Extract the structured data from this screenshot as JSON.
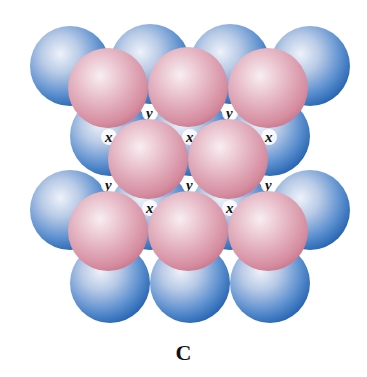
{
  "figure": {
    "caption": "C",
    "colors": {
      "layer_a": "#3f7fc4",
      "layer_a_highlight": "#e8eef8",
      "layer_b": "#d98a9e",
      "layer_b_highlight": "#f6e8ee",
      "label": "#111111"
    },
    "radius": 40,
    "layers": [
      {
        "name": "bottom-layer-blue",
        "color": "blue",
        "spheres": [
          {
            "cx": 70,
            "cy": 66
          },
          {
            "cx": 150,
            "cy": 64
          },
          {
            "cx": 230,
            "cy": 64
          },
          {
            "cx": 310,
            "cy": 66
          },
          {
            "cx": 110,
            "cy": 136
          },
          {
            "cx": 190,
            "cy": 136
          },
          {
            "cx": 270,
            "cy": 136
          },
          {
            "cx": 70,
            "cy": 210
          },
          {
            "cx": 150,
            "cy": 210
          },
          {
            "cx": 230,
            "cy": 210
          },
          {
            "cx": 310,
            "cy": 210
          },
          {
            "cx": 110,
            "cy": 283
          },
          {
            "cx": 190,
            "cy": 283
          },
          {
            "cx": 270,
            "cy": 283
          }
        ]
      },
      {
        "name": "top-layer-pink",
        "color": "pink",
        "spheres": [
          {
            "cx": 108,
            "cy": 88
          },
          {
            "cx": 188,
            "cy": 87
          },
          {
            "cx": 268,
            "cy": 88
          },
          {
            "cx": 148,
            "cy": 159
          },
          {
            "cx": 228,
            "cy": 159
          },
          {
            "cx": 108,
            "cy": 231
          },
          {
            "cx": 188,
            "cy": 231
          },
          {
            "cx": 268,
            "cy": 231
          }
        ]
      }
    ],
    "hole_labels": [
      {
        "text": "y",
        "x": 146,
        "y": 118
      },
      {
        "text": "y",
        "x": 226,
        "y": 118
      },
      {
        "text": "x",
        "x": 105,
        "y": 142
      },
      {
        "text": "x",
        "x": 186,
        "y": 142
      },
      {
        "text": "x",
        "x": 265,
        "y": 142
      },
      {
        "text": "y",
        "x": 105,
        "y": 190
      },
      {
        "text": "y",
        "x": 186,
        "y": 190
      },
      {
        "text": "y",
        "x": 265,
        "y": 190
      },
      {
        "text": "x",
        "x": 146,
        "y": 213
      },
      {
        "text": "x",
        "x": 226,
        "y": 213
      }
    ]
  }
}
